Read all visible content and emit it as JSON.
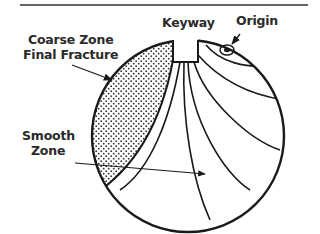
{
  "diagram": {
    "labels": {
      "coarse_zone_line1": "Coarse Zone",
      "coarse_zone_line2": "Final Fracture",
      "keyway": "Keyway",
      "origin": "Origin",
      "smooth_zone_line1": "Smooth",
      "smooth_zone_line2": "Zone"
    },
    "colors": {
      "stroke": "#1a1a1a",
      "text": "#2a2a2a",
      "background": "#ffffff",
      "stipple": "#333333"
    }
  }
}
